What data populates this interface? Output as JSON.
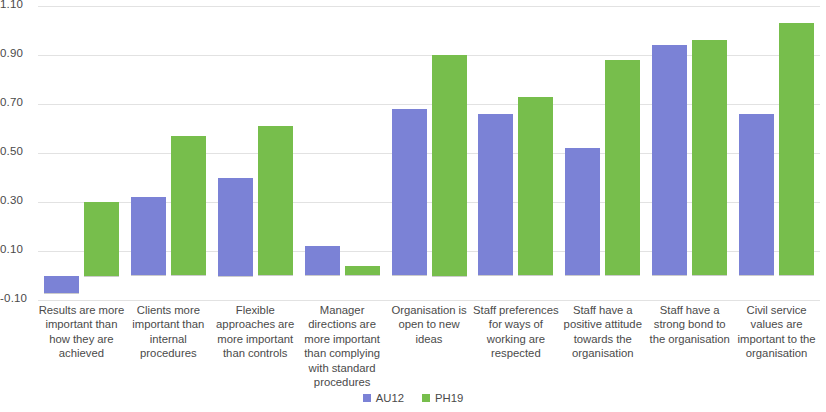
{
  "chart_data": {
    "type": "bar",
    "title": "",
    "subtitle": "",
    "xlabel": "",
    "ylabel": "",
    "ylim": [
      -0.1,
      1.1
    ],
    "ytick_labels": [
      "1.10",
      "0.90",
      "0.70",
      "0.50",
      "0.30",
      "0.10",
      "-0.10"
    ],
    "ytick_values": [
      1.1,
      0.9,
      0.7,
      0.5,
      0.3,
      0.1,
      -0.1
    ],
    "grid": true,
    "grid_axis": "y",
    "legend_position": "bottom-center",
    "categories": [
      "Results are more important than how they are achieved",
      "Clients more important than internal procedures",
      "Flexible approaches are more important than controls",
      "Manager directions are more important than complying with standard procedures",
      "Organisation is open to new ideas",
      "Staff preferences for ways of working are respected",
      "Staff have a positive attitude towards the organisation",
      "Staff have a strong bond to the organisation",
      "Civil service values are important to the organisation"
    ],
    "series": [
      {
        "name": "AU12",
        "color": "#7b82d6",
        "values": [
          -0.07,
          0.32,
          0.4,
          0.12,
          0.68,
          0.66,
          0.52,
          0.94,
          0.66
        ]
      },
      {
        "name": "PH19",
        "color": "#77be4c",
        "values": [
          0.3,
          0.57,
          0.61,
          0.04,
          0.9,
          0.73,
          0.88,
          0.96,
          1.03
        ]
      }
    ]
  },
  "legend": {
    "items": [
      {
        "label": "AU12",
        "color": "#7b82d6"
      },
      {
        "label": "PH19",
        "color": "#77be4c"
      }
    ]
  }
}
